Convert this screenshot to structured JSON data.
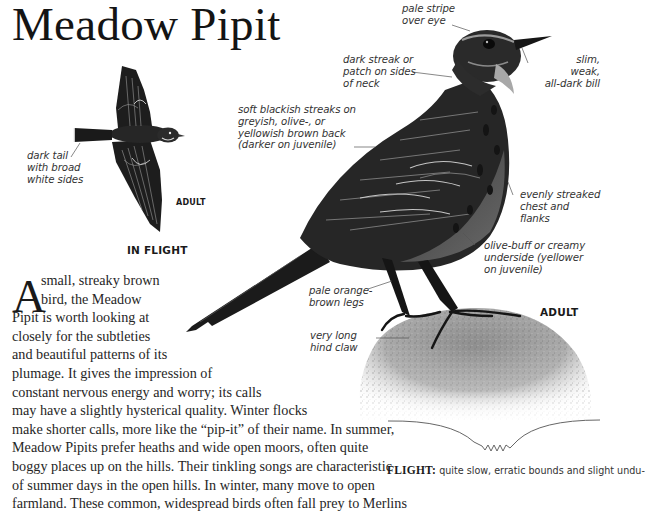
{
  "page": {
    "title": "Meadow Pipit"
  },
  "flight_illustration": {
    "annotation": [
      "dark tail",
      "with broad",
      "white sides"
    ],
    "age_label": "ADULT",
    "caption": "IN FLIGHT"
  },
  "main_illustration": {
    "age_label": "ADULT",
    "annotations": {
      "pale_stripe": [
        "pale stripe",
        "over eye"
      ],
      "neck_streak": [
        "dark streak or",
        "patch on sides",
        "of neck"
      ],
      "bill": [
        "slim, weak,",
        "all-dark bill"
      ],
      "back": [
        "soft blackish streaks on",
        "greyish, olive-, or",
        "yellowish brown back",
        "(darker on juvenile)"
      ],
      "chest": [
        "evenly streaked",
        "chest and flanks"
      ],
      "underside": [
        "olive-buff or creamy",
        "underside (yellower",
        "on juvenile)"
      ],
      "legs": [
        "pale orange-",
        "brown legs"
      ],
      "claw": [
        "very long",
        "hind claw"
      ]
    }
  },
  "body": {
    "dropcap": "A",
    "lines": [
      "small, streaky brown",
      "bird, the Meadow",
      "Pipit is worth looking at",
      "closely for the subtleties",
      "and beautiful patterns of its",
      "plumage. It gives the impression of",
      "constant nervous energy and worry; its calls",
      "may have a slightly hysterical quality. Winter flocks",
      "make shorter calls, more like the “pip-it” of their name. In summer,",
      "Meadow Pipits prefer heaths and wide open moors, often quite",
      "boggy places up on the hills. Their tinkling songs are characteristic",
      "of summer days in the open hills. In winter, many move to open",
      "farmland. These common, widespread birds often fall prey to Merlins"
    ]
  },
  "flight_pattern": {
    "label": "FLIGHT:",
    "text": "quite slow, erratic bounds and slight undu-"
  },
  "colors": {
    "text": "#1a1a1a",
    "annotation": "#333333",
    "bird": "#1c1c1c",
    "rock": "#9a9a9a"
  }
}
